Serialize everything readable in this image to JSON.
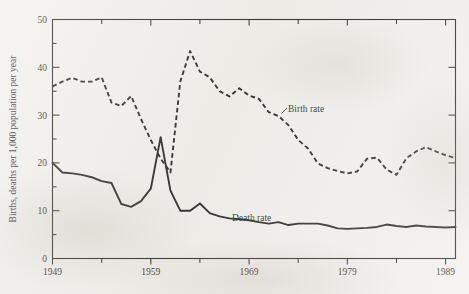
{
  "chart_data": {
    "type": "line",
    "title": "",
    "xlabel": "",
    "ylabel": "Births, deaths per 1,000 population per year",
    "xlim": [
      1949,
      1990
    ],
    "ylim": [
      0,
      50
    ],
    "grid": false,
    "legend_position": "inline-annotation",
    "x_major_ticks": [
      1949,
      1959,
      1969,
      1979,
      1989
    ],
    "x_major_tick_labels": [
      "1949",
      "1959",
      "1969",
      "1979",
      "1989"
    ],
    "x_minor_ticks": [
      1954,
      1964,
      1974,
      1984
    ],
    "y_major_ticks": [
      0,
      10,
      20,
      30,
      40,
      50
    ],
    "y_major_tick_labels": [
      "0",
      "10",
      "20",
      "30",
      "40",
      "50"
    ],
    "y_minor_ticks": [
      5,
      15,
      25,
      35,
      45
    ],
    "x": [
      1949,
      1950,
      1951,
      1952,
      1953,
      1954,
      1955,
      1956,
      1957,
      1958,
      1959,
      1960,
      1961,
      1962,
      1963,
      1964,
      1965,
      1966,
      1967,
      1968,
      1969,
      1970,
      1971,
      1972,
      1973,
      1974,
      1975,
      1976,
      1977,
      1978,
      1979,
      1980,
      1981,
      1982,
      1983,
      1984,
      1985,
      1986,
      1987,
      1988,
      1989,
      1990
    ],
    "series": [
      {
        "name": "Birth rate",
        "style": "dashed",
        "label": "Birth rate",
        "values": [
          36.0,
          37.0,
          37.8,
          37.0,
          37.0,
          37.9,
          32.6,
          31.9,
          34.0,
          29.2,
          24.8,
          20.9,
          18.0,
          37.0,
          43.4,
          39.1,
          37.9,
          35.0,
          33.9,
          35.6,
          34.1,
          33.4,
          30.6,
          29.8,
          27.9,
          24.8,
          23.0,
          19.9,
          18.9,
          18.3,
          17.8,
          18.2,
          20.9,
          21.1,
          18.6,
          17.5,
          21.0,
          22.4,
          23.3,
          22.4,
          21.6,
          21.0
        ]
      },
      {
        "name": "Death rate",
        "style": "solid",
        "label": "Death rate",
        "values": [
          20.0,
          18.0,
          17.8,
          17.5,
          17.0,
          16.2,
          15.8,
          11.4,
          10.8,
          12.0,
          14.6,
          25.4,
          14.2,
          10.0,
          10.0,
          11.5,
          9.5,
          8.8,
          8.4,
          8.2,
          8.0,
          7.6,
          7.3,
          7.6,
          7.0,
          7.3,
          7.3,
          7.3,
          6.9,
          6.3,
          6.2,
          6.3,
          6.4,
          6.6,
          7.1,
          6.8,
          6.6,
          6.9,
          6.7,
          6.6,
          6.5,
          6.6
        ]
      }
    ],
    "annotations": [
      {
        "text": "Birth rate",
        "x": 1974,
        "y": 30.0
      },
      {
        "text": "Death rate",
        "x": 1969,
        "y": 10.5
      }
    ]
  }
}
